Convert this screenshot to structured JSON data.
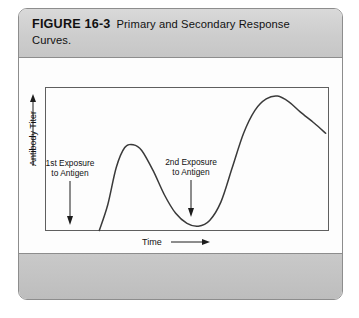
{
  "figure": {
    "label": "FIGURE 16-3",
    "caption": "Primary and Secondary Response Curves."
  },
  "colors": {
    "panel_border": "#8d8d8d",
    "caption_band": "#cdcdcd",
    "footer_band": "#c2c2c2",
    "plot_background": "#fdfdfd",
    "plot_frame": "#5f5f5f",
    "curve": "#3a3a3a",
    "text": "#111111"
  },
  "chart_data": {
    "type": "line",
    "title": "Primary and Secondary Response Curves.",
    "xlabel": "Time",
    "ylabel": "Antibody Titer",
    "grid": false,
    "legend": null,
    "axis_arrows": {
      "x": "right",
      "y": "up"
    },
    "xlim": [
      0,
      100
    ],
    "ylim": [
      0,
      100
    ],
    "tick_labels": {
      "x": [],
      "y": []
    },
    "annotations": [
      {
        "name": "first-exposure",
        "line1": "1st Exposure",
        "line2": "to Antigen",
        "arrow_direction": "down",
        "x": 9,
        "y_from": 52,
        "y_to": 6
      },
      {
        "name": "second-exposure",
        "line1": "2nd Exposure",
        "line2": "to Antigen",
        "arrow_direction": "down",
        "x": 52,
        "y_from": 52,
        "y_to": 9
      }
    ],
    "series": [
      {
        "name": "Antibody titer response",
        "points": [
          {
            "x": 19,
            "y": 0
          },
          {
            "x": 22,
            "y": 18
          },
          {
            "x": 25,
            "y": 44
          },
          {
            "x": 28,
            "y": 58
          },
          {
            "x": 31,
            "y": 60
          },
          {
            "x": 34,
            "y": 56
          },
          {
            "x": 38,
            "y": 42
          },
          {
            "x": 42,
            "y": 25
          },
          {
            "x": 46,
            "y": 12
          },
          {
            "x": 50,
            "y": 5
          },
          {
            "x": 54,
            "y": 3
          },
          {
            "x": 58,
            "y": 7
          },
          {
            "x": 62,
            "y": 20
          },
          {
            "x": 66,
            "y": 44
          },
          {
            "x": 70,
            "y": 68
          },
          {
            "x": 74,
            "y": 84
          },
          {
            "x": 78,
            "y": 92
          },
          {
            "x": 82,
            "y": 94
          },
          {
            "x": 86,
            "y": 90
          },
          {
            "x": 90,
            "y": 83
          },
          {
            "x": 95,
            "y": 75
          },
          {
            "x": 99,
            "y": 68
          }
        ]
      }
    ]
  }
}
